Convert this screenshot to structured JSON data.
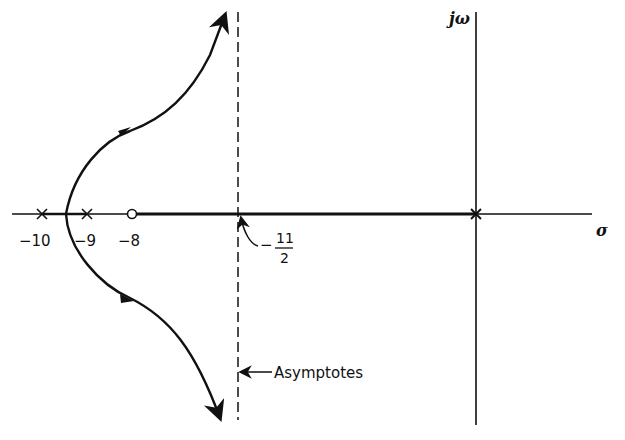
{
  "diagram": {
    "type": "root-locus",
    "axes": {
      "real_axis_label": "σ",
      "imag_axis_label": "jω"
    },
    "poles": [
      {
        "label": "−10",
        "value": -10
      },
      {
        "label": "−9",
        "value": -9
      },
      {
        "label": "0",
        "value": 0
      }
    ],
    "zeros": [
      {
        "label": "−8",
        "value": -8
      }
    ],
    "asymptote": {
      "centroid_label_num": "11",
      "centroid_label_den": "2",
      "centroid_sign": "−",
      "centroid_value": -5.5,
      "annotation": "Asymptotes"
    },
    "colors": {
      "ink": "#111111",
      "background": "#ffffff"
    }
  }
}
